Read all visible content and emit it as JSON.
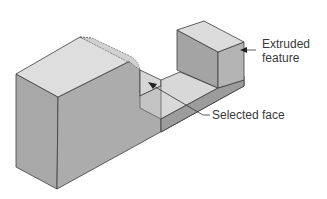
{
  "figure": {
    "type": "isometric-solid-model",
    "colors": {
      "background": "#ffffff",
      "top_face": "#dcdcdc",
      "front_face": "#a9a9a9",
      "side_face": "#9a9a9a",
      "inner_face": "#c8c8c8",
      "edge": "#3c3c3c",
      "label_text": "#3a3a3a"
    }
  },
  "callouts": [
    {
      "id": "extruded-feature",
      "lines": [
        "Extruded",
        "feature"
      ]
    },
    {
      "id": "selected-face",
      "lines": [
        "Selected face"
      ]
    }
  ]
}
